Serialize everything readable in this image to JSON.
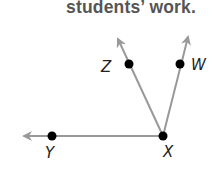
{
  "caption": "students’ work.",
  "diagram": {
    "type": "rays from common vertex",
    "vertex": {
      "label": "X",
      "x": 163,
      "y": 136
    },
    "points": [
      {
        "label": "Y",
        "x": 52,
        "y": 136,
        "label_x": 46,
        "label_y": 157
      },
      {
        "label": "Z",
        "x": 129,
        "y": 64,
        "label_x": 100,
        "label_y": 72
      },
      {
        "label": "W",
        "x": 180,
        "y": 64,
        "label_x": 192,
        "label_y": 70
      },
      {
        "label": "X",
        "x": 163,
        "y": 136,
        "label_x": 163,
        "label_y": 157
      }
    ],
    "rays": [
      {
        "name": "XY",
        "to": "Y",
        "arrow_tip": [
          20,
          136
        ]
      },
      {
        "name": "XZ",
        "to": "Z",
        "arrow_tip": [
          116,
          35
        ]
      },
      {
        "name": "XW",
        "to": "W",
        "arrow_tip": [
          189,
          33
        ]
      }
    ],
    "colors": {
      "ray": "#999999",
      "point": "#000000",
      "label": "#222222",
      "caption": "#555555"
    }
  }
}
